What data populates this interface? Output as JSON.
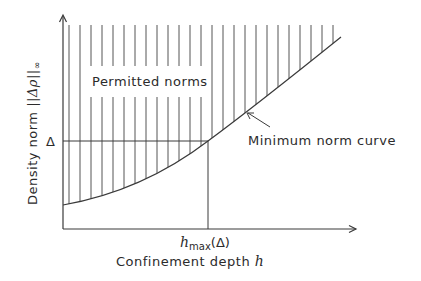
{
  "diagram": {
    "type": "region-diagram",
    "axes": {
      "x_label_text": "Confinement depth ",
      "x_label_var": "h",
      "y_label_text": "Density norm ",
      "y_label_norm": "||Δρ||",
      "y_label_sub": "∞"
    },
    "labels": {
      "region": "Permitted norms",
      "curve": "Minimum norm curve",
      "delta_tick": "Δ",
      "hmax_base": "h",
      "hmax_sub": "max",
      "hmax_arg": "(Δ)"
    },
    "colors": {
      "stroke": "#3a3a3a",
      "hatch": "#555555",
      "background": "#ffffff"
    }
  }
}
